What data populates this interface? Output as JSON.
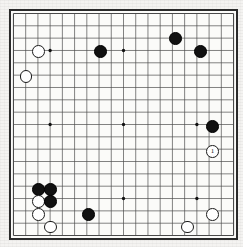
{
  "board": {
    "name": "go-board",
    "size": 19,
    "grid_color": "#4a4a4a",
    "border_color": "#2b2b2b",
    "board_color": "#fbfbf9",
    "background_color": "#f4f3f1",
    "star_points": [
      {
        "col": 3,
        "row": 3
      },
      {
        "col": 9,
        "row": 3
      },
      {
        "col": 15,
        "row": 3
      },
      {
        "col": 3,
        "row": 9
      },
      {
        "col": 9,
        "row": 9
      },
      {
        "col": 15,
        "row": 9
      },
      {
        "col": 3,
        "row": 15
      },
      {
        "col": 9,
        "row": 15
      },
      {
        "col": 15,
        "row": 15
      }
    ],
    "stones": [
      {
        "col": 2,
        "row": 3,
        "color": "white",
        "label": ""
      },
      {
        "col": 1,
        "row": 5,
        "color": "white",
        "label": ""
      },
      {
        "col": 7,
        "row": 3,
        "color": "black",
        "label": ""
      },
      {
        "col": 13,
        "row": 2,
        "color": "black",
        "label": ""
      },
      {
        "col": 15,
        "row": 3,
        "color": "black",
        "label": ""
      },
      {
        "col": 16,
        "row": 9,
        "color": "black",
        "label": ""
      },
      {
        "col": 16,
        "row": 11,
        "color": "white",
        "label": "1"
      },
      {
        "col": 2,
        "row": 14,
        "color": "black",
        "label": ""
      },
      {
        "col": 3,
        "row": 14,
        "color": "black",
        "label": ""
      },
      {
        "col": 2,
        "row": 15,
        "color": "white",
        "label": ""
      },
      {
        "col": 3,
        "row": 15,
        "color": "black",
        "label": ""
      },
      {
        "col": 2,
        "row": 16,
        "color": "white",
        "label": ""
      },
      {
        "col": 3,
        "row": 17,
        "color": "white",
        "label": ""
      },
      {
        "col": 6,
        "row": 16,
        "color": "black",
        "label": ""
      },
      {
        "col": 16,
        "row": 16,
        "color": "white",
        "label": ""
      },
      {
        "col": 14,
        "row": 17,
        "color": "white",
        "label": ""
      }
    ],
    "last_move_number": "1"
  }
}
